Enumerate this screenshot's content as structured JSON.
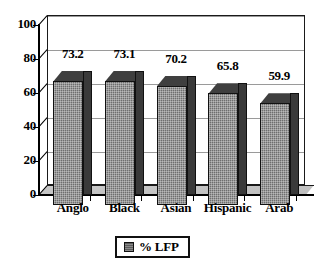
{
  "chart_data": {
    "type": "bar",
    "title": "",
    "subtitle": "",
    "xlabel": "",
    "ylabel": "",
    "categories": [
      "Anglo",
      "Black",
      "Asian",
      "Hispanic",
      "Arab"
    ],
    "values": [
      73.2,
      73.1,
      70.2,
      65.8,
      59.9
    ],
    "value_labels": [
      "73.2",
      "73.1",
      "70.2",
      "65.8",
      "59.9"
    ],
    "series": [
      {
        "name": "% LFP",
        "values": [
          73.2,
          73.1,
          70.2,
          65.8,
          59.9
        ]
      }
    ],
    "ylim": [
      0,
      100
    ],
    "y_ticks": [
      0,
      20,
      40,
      60,
      80,
      100
    ],
    "y_tick_labels": [
      "0",
      "20",
      "40",
      "60",
      "80",
      "100"
    ],
    "grid": true,
    "grid_axis": "y",
    "legend": {
      "position": "bottom",
      "entries": [
        {
          "label": "% LFP",
          "swatch_color": "#5c5c5c"
        }
      ]
    },
    "style": {
      "three_d": true,
      "bar_face_color": "#6e6e6e",
      "bar_side_color": "#3a3a3a",
      "bar_top_color": "#4a4a4a",
      "bar_edge_color": "#111111",
      "gridline_color": "#9a9a9a",
      "axis_color": "#000000",
      "background_color": "#ffffff",
      "floor_color": "#c4c4c4"
    }
  }
}
